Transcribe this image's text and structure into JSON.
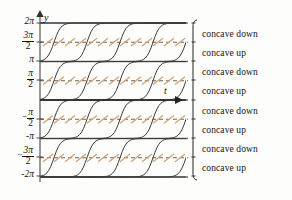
{
  "figure": {
    "kind": "slope-field-with-solution-curves",
    "background_color": "#fdfdfb",
    "curve_color": "#3c3c3c",
    "equilibrium_color": "#6b6b6b",
    "dashed_color": "#555555",
    "slope_mark_color": "#d9a173",
    "axis_color": "#555555",
    "text_color": "#111111"
  },
  "axes": {
    "y_axis_label": "y",
    "t_axis_label": "t",
    "y_axis_x_px": 40,
    "t_axis_y_px": 100,
    "plot_right_px": 186,
    "y_ticks": [
      {
        "label": "2π",
        "type": "plain",
        "value": 6.2832,
        "y_px": 23,
        "line": "solid"
      },
      {
        "label": "3π/2",
        "type": "fraction",
        "numerator": "3π",
        "denominator": "2",
        "negative": false,
        "value": 4.7124,
        "y_px": 42,
        "line": "dashed"
      },
      {
        "label": "π",
        "type": "plain",
        "value": 3.1416,
        "y_px": 61,
        "line": "solid"
      },
      {
        "label": "π/2",
        "type": "fraction",
        "numerator": "π",
        "denominator": "2",
        "negative": false,
        "value": 1.5708,
        "y_px": 80,
        "line": "dashed"
      },
      {
        "label": "-π/2",
        "type": "fraction",
        "numerator": "π",
        "denominator": "2",
        "negative": true,
        "value": -1.5708,
        "y_px": 119,
        "line": "dashed"
      },
      {
        "label": "-π",
        "type": "plain",
        "value": -3.1416,
        "y_px": 138,
        "line": "solid"
      },
      {
        "label": "-3π/2",
        "type": "fraction",
        "numerator": "3π",
        "denominator": "2",
        "negative": true,
        "value": -4.7124,
        "y_px": 157,
        "line": "dashed"
      },
      {
        "label": "-2π",
        "type": "plain",
        "value": -6.2832,
        "y_px": 176,
        "line": "solid"
      }
    ],
    "equilibria_values": [
      6.2832,
      3.1416,
      0,
      -3.1416,
      -6.2832
    ],
    "inflection_values": [
      4.7124,
      1.5708,
      -1.5708,
      -4.7124
    ]
  },
  "bands": [
    {
      "index": 0,
      "label": "concave down",
      "top_y_px": 23,
      "bottom_y_px": 42,
      "label_y_px": 30
    },
    {
      "index": 1,
      "label": "concave up",
      "top_y_px": 42,
      "bottom_y_px": 61,
      "label_y_px": 49
    },
    {
      "index": 2,
      "label": "concave down",
      "top_y_px": 61,
      "bottom_y_px": 80,
      "label_y_px": 68
    },
    {
      "index": 3,
      "label": "concave up",
      "top_y_px": 80,
      "bottom_y_px": 100,
      "label_y_px": 87
    },
    {
      "index": 4,
      "label": "concave down",
      "top_y_px": 100,
      "bottom_y_px": 119,
      "label_y_px": 107
    },
    {
      "index": 5,
      "label": "concave up",
      "top_y_px": 119,
      "bottom_y_px": 138,
      "label_y_px": 126
    },
    {
      "index": 6,
      "label": "concave down",
      "top_y_px": 138,
      "bottom_y_px": 157,
      "label_y_px": 145
    },
    {
      "index": 7,
      "label": "concave up",
      "top_y_px": 157,
      "bottom_y_px": 176,
      "label_y_px": 164
    }
  ],
  "brace": {
    "x_px": 193,
    "top_y_px": 20,
    "bottom_y_px": 180,
    "tick_count": 9
  },
  "chart_data": {
    "type": "line",
    "title": "",
    "xlabel": "t",
    "ylabel": "y",
    "xlim": [
      0,
      3.6
    ],
    "ylim": [
      -6.2832,
      6.2832
    ],
    "grid": false,
    "legend": null,
    "series": [
      {
        "name": "equilibrium y=2π",
        "kind": "equilibrium",
        "value": 6.2832
      },
      {
        "name": "equilibrium y=π",
        "kind": "equilibrium",
        "value": 3.1416
      },
      {
        "name": "equilibrium y=0",
        "kind": "equilibrium",
        "value": 0
      },
      {
        "name": "equilibrium y=-π",
        "kind": "equilibrium",
        "value": -3.1416
      },
      {
        "name": "equilibrium y=-2π",
        "kind": "equilibrium",
        "value": -6.2832
      },
      {
        "name": "inflection y=3π/2",
        "kind": "inflection",
        "value": 4.7124
      },
      {
        "name": "inflection y=π/2",
        "kind": "inflection",
        "value": 1.5708
      },
      {
        "name": "inflection y=-π/2",
        "kind": "inflection",
        "value": -1.5708
      },
      {
        "name": "inflection y=-3π/2",
        "kind": "inflection",
        "value": -4.7124
      }
    ],
    "solution_bands": [
      {
        "from": 3.1416,
        "to": 6.2832,
        "inflection": 4.7124,
        "direction": "increasing"
      },
      {
        "from": 0,
        "to": 3.1416,
        "inflection": 1.5708,
        "direction": "increasing"
      },
      {
        "from": -3.1416,
        "to": 0,
        "inflection": -1.5708,
        "direction": "increasing"
      },
      {
        "from": -6.2832,
        "to": -3.1416,
        "inflection": -4.7124,
        "direction": "increasing"
      }
    ],
    "annotations": [
      "concave down",
      "concave up",
      "concave down",
      "concave up",
      "concave down",
      "concave up",
      "concave down",
      "concave up"
    ]
  }
}
